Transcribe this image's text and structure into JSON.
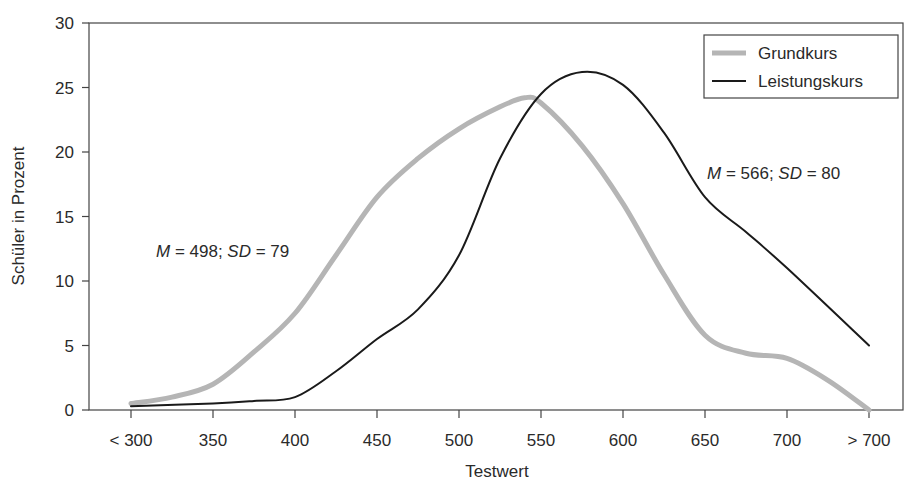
{
  "chart_data": {
    "type": "line",
    "title": "",
    "xlabel": "Testwert",
    "ylabel": "Schüler in Prozent",
    "ylim": [
      0,
      30
    ],
    "yticks": [
      0,
      5,
      10,
      15,
      20,
      25,
      30
    ],
    "categories": [
      "< 300",
      "350",
      "400",
      "450",
      "500",
      "550",
      "600",
      "650",
      "700",
      "> 700"
    ],
    "grid": false,
    "legend_position": "top-right",
    "series": [
      {
        "name": "Grundkurs",
        "color": "#b5b5b5",
        "style": "thick-gray",
        "x": [
          0,
          0.5,
          1,
          1.5,
          2,
          2.5,
          3,
          3.5,
          4,
          4.5,
          4.8,
          5,
          5.5,
          6,
          6.5,
          7,
          7.5,
          8,
          8.5,
          9
        ],
        "values": [
          0.5,
          1.0,
          2.0,
          4.5,
          7.5,
          12.0,
          16.5,
          19.5,
          21.8,
          23.5,
          24.2,
          23.8,
          20.5,
          16.0,
          10.5,
          5.8,
          4.4,
          4.0,
          2.3,
          0.0
        ]
      },
      {
        "name": "Leistungskurs",
        "color": "#1a1a1a",
        "style": "thin-black",
        "x": [
          0,
          1,
          1.5,
          2,
          2.5,
          3,
          3.5,
          4,
          4.5,
          5,
          5.5,
          6,
          6.5,
          7,
          7.5,
          8,
          9
        ],
        "values": [
          0.3,
          0.5,
          0.7,
          1.0,
          3.0,
          5.5,
          7.8,
          12.0,
          19.5,
          24.5,
          26.2,
          25.2,
          21.5,
          16.5,
          13.8,
          11.0,
          5.0
        ]
      }
    ],
    "annotations": [
      {
        "series": "Grundkurs",
        "M": "498",
        "SD": "79"
      },
      {
        "series": "Leistungskurs",
        "M": "566",
        "SD": "80"
      }
    ]
  },
  "annotations": {
    "grundkurs": {
      "m_label": "M",
      "m_rest": " = 498; ",
      "sd_label": "SD",
      "sd_rest": " = 79"
    },
    "leistungskurs": {
      "m_label": "M",
      "m_rest": " = 566; ",
      "sd_label": "SD",
      "sd_rest": " = 80"
    }
  },
  "legend": {
    "items": [
      {
        "label": "Grundkurs"
      },
      {
        "label": "Leistungskurs"
      }
    ]
  },
  "axes": {
    "x_title": "Testwert",
    "y_title": "Schüler in Prozent",
    "x_labels": [
      "< 300",
      "350",
      "400",
      "450",
      "500",
      "550",
      "600",
      "650",
      "700",
      "> 700"
    ],
    "y_labels": [
      "0",
      "5",
      "10",
      "15",
      "20",
      "25",
      "30"
    ]
  }
}
